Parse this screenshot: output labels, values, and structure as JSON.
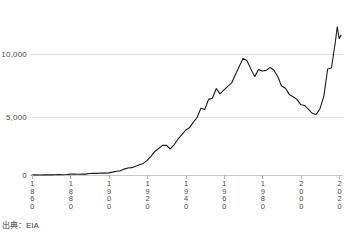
{
  "source_note": "出典：EIA",
  "chart_data": {
    "type": "line",
    "title": "",
    "subtitle": "",
    "xlabel": "",
    "ylabel": "",
    "grid": true,
    "legend": "none",
    "legend_entries": [],
    "annotations": [],
    "line_color": "#1a1a1a",
    "grid_color": "#e3e3e3",
    "axis_color": "#c9c9c9",
    "xlim": [
      1859,
      2022
    ],
    "ylim": [
      0,
      13500
    ],
    "xticks": [
      1860,
      1880,
      1900,
      1920,
      1940,
      1960,
      1980,
      2000,
      2020
    ],
    "xtick_labels": [
      "1860",
      "1880",
      "1900",
      "1920",
      "1940",
      "1960",
      "1980",
      "2000",
      "2020"
    ],
    "yticks": [
      0,
      5000,
      10000
    ],
    "ytick_labels": [
      "0",
      "5,000",
      "10,000"
    ],
    "x": [
      1860,
      1862,
      1864,
      1866,
      1868,
      1870,
      1872,
      1874,
      1876,
      1878,
      1880,
      1882,
      1884,
      1886,
      1888,
      1890,
      1892,
      1894,
      1896,
      1898,
      1900,
      1902,
      1904,
      1906,
      1908,
      1910,
      1912,
      1914,
      1916,
      1918,
      1920,
      1922,
      1924,
      1926,
      1928,
      1930,
      1932,
      1934,
      1936,
      1938,
      1940,
      1942,
      1944,
      1946,
      1948,
      1950,
      1952,
      1954,
      1956,
      1958,
      1960,
      1962,
      1964,
      1966,
      1968,
      1970,
      1972,
      1974,
      1976,
      1978,
      1980,
      1982,
      1984,
      1986,
      1988,
      1990,
      1992,
      1994,
      1996,
      1998,
      2000,
      2002,
      2004,
      2006,
      2008,
      2010,
      2012,
      2014,
      2016,
      2018,
      2019,
      2020,
      2021
    ],
    "values": [
      1,
      8,
      6,
      10,
      13,
      14,
      18,
      30,
      25,
      42,
      72,
      85,
      65,
      77,
      75,
      126,
      140,
      135,
      167,
      152,
      174,
      240,
      315,
      342,
      488,
      574,
      607,
      722,
      843,
      955,
      1214,
      1536,
      1955,
      2190,
      2450,
      2460,
      2150,
      2480,
      2960,
      3310,
      3700,
      3900,
      4350,
      4750,
      5520,
      5410,
      6250,
      6340,
      7150,
      6710,
      7040,
      7330,
      7610,
      8300,
      8980,
      9640,
      9440,
      8770,
      8130,
      8710,
      8600,
      8650,
      8880,
      8680,
      8140,
      7360,
      7170,
      6660,
      6470,
      6250,
      5820,
      5750,
      5420,
      5100,
      5000,
      5480,
      6500,
      8760,
      8840,
      10990,
      12250,
      11280,
      11560
    ],
    "series_name": "U.S. crude oil production",
    "value_unit": "thousand barrels per day",
    "notable_points": [
      {
        "year": 1970,
        "value": 9640,
        "note": "peak"
      },
      {
        "year": 2008,
        "value": 5000,
        "note": "trough"
      },
      {
        "year": 2019,
        "value": 12250,
        "note": "record high"
      }
    ]
  }
}
